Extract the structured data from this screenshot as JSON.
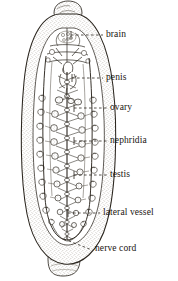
{
  "figure": {
    "kind": "anatomical-line-drawing",
    "view": "whole body, anterior at top, posterior at bottom",
    "background_color": "#ffffff",
    "ink_color": "#18140f",
    "body_fill_color": "#ffffff",
    "stipple_color": "#9a9387",
    "organ_tint_color": "#b9b2a6"
  },
  "labels": [
    {
      "id": "brain",
      "text": "brain",
      "leader_from": [
        71,
        35
      ],
      "leader_to": [
        103,
        35
      ],
      "dash": "dashed"
    },
    {
      "id": "penis",
      "text": "penis",
      "leader_from": [
        72,
        78
      ],
      "leader_to": [
        103,
        78
      ],
      "dash": "dashed"
    },
    {
      "id": "ovary",
      "text": "ovary",
      "leader_from": [
        74,
        108
      ],
      "leader_to": [
        107,
        108
      ],
      "dash": "dashed"
    },
    {
      "id": "nephridia",
      "text": "nephridia",
      "leader_from": [
        74,
        141
      ],
      "leader_to": [
        107,
        141
      ],
      "dash": "dashed"
    },
    {
      "id": "testis",
      "text": "testis",
      "leader_from": [
        74,
        175
      ],
      "leader_to": [
        107,
        175
      ],
      "dash": "dashed"
    },
    {
      "id": "lateral-vessel",
      "text": "lateral  vessel",
      "leader_from": [
        68,
        213
      ],
      "leader_to": [
        100,
        213
      ],
      "dash": "dashed"
    },
    {
      "id": "nerve-cord",
      "text": "nerve cord",
      "leader_from": [
        64,
        239
      ],
      "leader_to": [
        92,
        250
      ],
      "dash": "dashed"
    }
  ],
  "structures": {
    "body_outline": "elongate ovoid trunk with rounded anterior and posterior lobes",
    "anterior_sucker": "small cap at top of body",
    "posterior_sucker": "small cap at bottom of body",
    "segment_count_visible": 14,
    "nerve_cord": "median longitudinal cord with paired segmental ganglia and lateral nerve branches",
    "lateral_vessels": "paired longitudinal vessels running the length of the body",
    "gonads": "paired rounded sacs arranged segmentally along each side",
    "nephridia": "coiled tubular structures lateral to the gonads"
  }
}
